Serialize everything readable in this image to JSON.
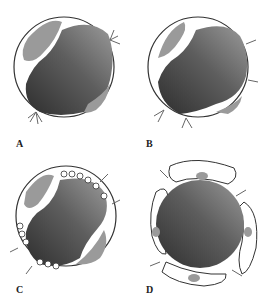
{
  "figure": {
    "panels": [
      {
        "id": "A",
        "label": "A"
      },
      {
        "id": "B",
        "label": "B"
      },
      {
        "id": "C",
        "label": "C"
      },
      {
        "id": "D",
        "label": "D"
      }
    ]
  },
  "colors": {
    "lumen_dark": "#3a3a3a",
    "lumen_light": "#8a8a8a",
    "inclusion": "#9a9a9a",
    "outline": "#333333",
    "background": "#ffffff"
  }
}
